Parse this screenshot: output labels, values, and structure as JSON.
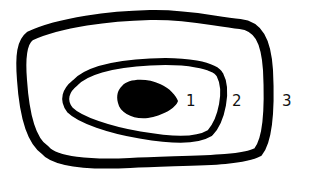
{
  "diagram": {
    "type": "nested-regions",
    "regions": [
      {
        "id": "core",
        "label": "1",
        "shape": "filled-blob"
      },
      {
        "id": "middle-ring",
        "label": "2",
        "shape": "irregular-oval-outline"
      },
      {
        "id": "outer-ring",
        "label": "3",
        "shape": "rounded-rectangle-outline"
      }
    ],
    "colors": {
      "stroke": "#000000",
      "background": "#ffffff"
    }
  }
}
